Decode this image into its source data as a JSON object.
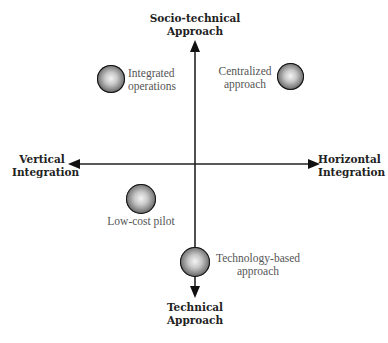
{
  "diagram": {
    "type": "quadrant",
    "axes": {
      "top": {
        "line1": "Socio-technical",
        "line2": "Approach"
      },
      "bottom": {
        "line1": "Technical",
        "line2": "Approach"
      },
      "left": {
        "line1": "Vertical",
        "line2": "Integration"
      },
      "right": {
        "line1": "Horizontal",
        "line2": "Integration"
      }
    },
    "nodes": [
      {
        "id": "integrated-operations",
        "line1": "Integrated",
        "line2": "operations",
        "quadrant": "top-left"
      },
      {
        "id": "centralized-approach",
        "line1": "Centralized",
        "line2": "approach",
        "quadrant": "top-right"
      },
      {
        "id": "low-cost-pilot",
        "line1": "Low-cost pilot",
        "line2": "",
        "quadrant": "bottom-left"
      },
      {
        "id": "technology-based-approach",
        "line1": "Technology-based",
        "line2": "approach",
        "quadrant": "bottom-center"
      }
    ],
    "colors": {
      "axis": "#222222",
      "axis_label": "#222222",
      "node_label": "#555555",
      "background": "#ffffff"
    }
  }
}
